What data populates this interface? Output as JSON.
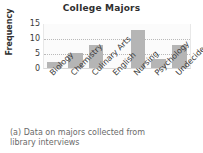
{
  "chart_data": {
    "type": "bar",
    "title": "College Majors",
    "xlabel": "",
    "ylabel": "Frequency",
    "categories": [
      "Biology",
      "Chemistry",
      "Culinary Arts",
      "English",
      "Nursing",
      "Psychology",
      "Undecided"
    ],
    "values": [
      2,
      5,
      8,
      0,
      13,
      3,
      8
    ],
    "ylim": [
      0,
      15
    ],
    "yticks": [
      0,
      5,
      10,
      15
    ],
    "ytick_labels": [
      "0",
      "5",
      "10",
      "15"
    ],
    "gridlines": [
      5,
      10
    ],
    "grid": true,
    "legend": "none",
    "bar_color": "#b5b5b5",
    "plot_background": "#fbfbfb"
  },
  "caption": {
    "line1": "(a) Data on majors collected from",
    "line2": "library interviews"
  }
}
